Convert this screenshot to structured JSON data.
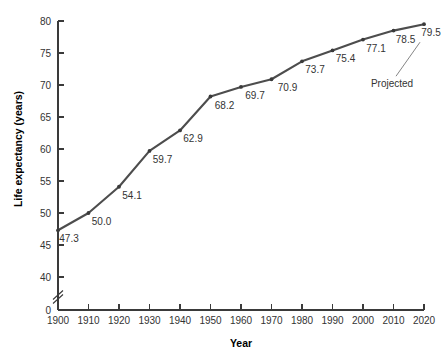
{
  "chart_data": {
    "type": "line",
    "title": "",
    "xlabel": "Year",
    "ylabel": "Life expectancy (years)",
    "x": [
      1900,
      1910,
      1920,
      1930,
      1940,
      1950,
      1960,
      1970,
      1980,
      1990,
      2000,
      2010,
      2020
    ],
    "values": [
      47.3,
      50.0,
      54.1,
      59.7,
      62.9,
      68.2,
      69.7,
      70.9,
      73.7,
      75.4,
      77.1,
      78.5,
      79.5
    ],
    "point_labels": [
      "47.3",
      "50.0",
      "54.1",
      "59.7",
      "62.9",
      "68.2",
      "69.7",
      "70.9",
      "73.7",
      "75.4",
      "77.1",
      "78.5",
      "79.5"
    ],
    "xtick_labels": [
      "1900",
      "1910",
      "1920",
      "1930",
      "1940",
      "1950",
      "1960",
      "1970",
      "1980",
      "1990",
      "2000",
      "2010",
      "2020"
    ],
    "ytick_labels": [
      "0",
      "40",
      "45",
      "50",
      "55",
      "60",
      "65",
      "70",
      "75",
      "80"
    ],
    "ytick_values": [
      0,
      40,
      45,
      50,
      55,
      60,
      65,
      70,
      75,
      80
    ],
    "ylim": [
      40,
      80
    ],
    "xlim": [
      1900,
      2020
    ],
    "axis_break": true,
    "axis_break_label": "axis-break",
    "grid": false,
    "legend": "none",
    "annotations": [
      {
        "text": "Projected",
        "target_x": 2020,
        "target_y": 79.5
      }
    ],
    "colors": {
      "line": "#4d4d4d",
      "marker": "#3a3a3a",
      "axis": "#3a3a3a",
      "text": "#333333",
      "background": "#ffffff"
    }
  }
}
